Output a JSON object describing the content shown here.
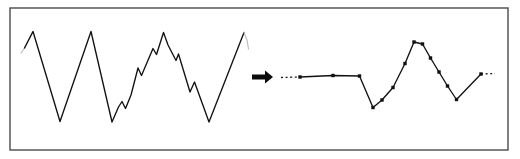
{
  "figure": {
    "background_color": "#ffffff",
    "stroke_color": "#111111",
    "faint_stroke_color": "#b4b4b4",
    "frame": {
      "name": "figure-border",
      "x": 10,
      "y": 8,
      "width": 498,
      "height": 142,
      "stroke_color": "#4a4a4a",
      "stroke_width": 1.4,
      "fill": "#ffffff"
    },
    "arrow": {
      "name": "transform-arrow",
      "label": "right-arrow",
      "shaft": {
        "x": 252,
        "y": 74.5,
        "width": 14,
        "height": 5
      },
      "head": {
        "points": "265,70.5 273,77 265,83.5"
      },
      "color": "#0d0d0d"
    },
    "panels": [
      {
        "name": "input-signal-panel",
        "label": "input jagged signal",
        "marker": "none",
        "stroke_width": 1.35,
        "lead_in": {
          "label": "faint-lead-in",
          "points": "21,53 24.5,48 33,31.5",
          "color": "#bdbdbd",
          "stroke_width": 1.2
        },
        "lead_out": {
          "label": "faint-lead-out",
          "points": "244,32.5 247,40 248.5,49",
          "color": "#bdbdbd",
          "stroke_width": 1.2
        },
        "points": [
          [
            24.5,
            48.0
          ],
          [
            33.0,
            31.5
          ],
          [
            60.0,
            121.5
          ],
          [
            91.0,
            31.5
          ],
          [
            112.0,
            122.0
          ],
          [
            118.5,
            107.0
          ],
          [
            122.0,
            101.5
          ],
          [
            125.5,
            108.5
          ],
          [
            131.0,
            95.0
          ],
          [
            138.0,
            68.0
          ],
          [
            141.5,
            75.5
          ],
          [
            153.0,
            48.5
          ],
          [
            156.5,
            54.5
          ],
          [
            163.5,
            32.5
          ],
          [
            168.0,
            45.0
          ],
          [
            176.0,
            60.5
          ],
          [
            178.5,
            54.0
          ],
          [
            190.0,
            92.0
          ],
          [
            194.5,
            82.0
          ],
          [
            209.0,
            122.0
          ],
          [
            244.0,
            32.5
          ]
        ]
      },
      {
        "name": "approximated-signal-panel",
        "label": "piecewise linear output with sample markers",
        "marker": "square",
        "marker_size": 3.4,
        "stroke_width": 1.35,
        "lead_in": {
          "label": "dotted-lead-in",
          "points": "281,77.5 300,77.0",
          "color": "#1a1a1a",
          "stroke_width": 1.3,
          "dash": "2,2.6"
        },
        "lead_out": {
          "label": "dotted-lead-out",
          "points": "481,74.0 495,73.5",
          "color": "#1a1a1a",
          "stroke_width": 1.3,
          "dash": "2,2.6"
        },
        "points": [
          [
            300.0,
            77.0
          ],
          [
            333.0,
            75.5
          ],
          [
            359.5,
            76.0
          ],
          [
            373.0,
            107.5
          ],
          [
            382.0,
            100.0
          ],
          [
            393.0,
            87.5
          ],
          [
            405.0,
            63.5
          ],
          [
            414.0,
            42.0
          ],
          [
            422.5,
            44.0
          ],
          [
            430.5,
            58.0
          ],
          [
            439.0,
            72.0
          ],
          [
            447.5,
            86.0
          ],
          [
            456.5,
            99.5
          ],
          [
            481.0,
            74.0
          ]
        ],
        "markers": [
          [
            300.0,
            77.0
          ],
          [
            333.0,
            75.5
          ],
          [
            359.5,
            76.0
          ],
          [
            373.0,
            107.5
          ],
          [
            382.0,
            100.0
          ],
          [
            393.0,
            87.5
          ],
          [
            405.0,
            63.5
          ],
          [
            414.0,
            42.0
          ],
          [
            422.5,
            44.0
          ],
          [
            430.5,
            58.0
          ],
          [
            439.0,
            72.0
          ],
          [
            447.5,
            86.0
          ],
          [
            456.5,
            99.5
          ],
          [
            481.0,
            74.0
          ]
        ]
      }
    ]
  }
}
